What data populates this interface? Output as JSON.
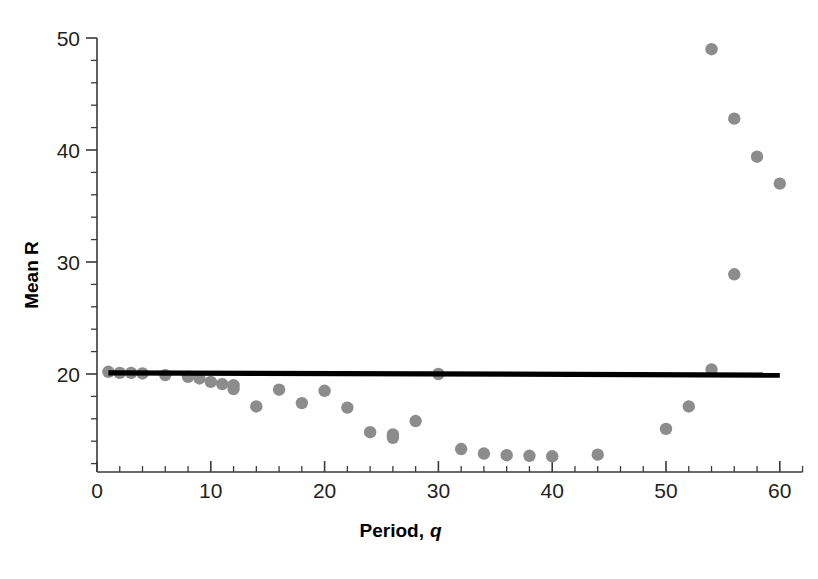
{
  "chart_data": {
    "type": "scatter",
    "title": "",
    "xlabel": "Period, q",
    "xlabel_parts": {
      "main": "Period,",
      "italic": "q"
    },
    "ylabel": "Mean R",
    "xlim": [
      0,
      62
    ],
    "ylim": [
      11,
      50
    ],
    "grid": false,
    "legend": null,
    "x_ticks_major": [
      0,
      10,
      20,
      30,
      40,
      50,
      60
    ],
    "x_tick_labels": [
      "0",
      "10",
      "20",
      "30",
      "40",
      "50",
      "60"
    ],
    "x_tick_minor_step": 2,
    "y_ticks_major": [
      20,
      30,
      40,
      50
    ],
    "y_tick_labels": [
      "20",
      "30",
      "40",
      "50"
    ],
    "y_tick_minor_step": 2,
    "series": [
      {
        "name": "Mean R",
        "type": "scatter",
        "marker": "circle",
        "color": "#8c8c8c",
        "x": [
          1,
          2,
          3,
          4,
          6,
          8,
          9,
          10,
          11,
          12,
          12,
          14,
          16,
          18,
          20,
          22,
          24,
          26,
          26,
          28,
          30,
          32,
          34,
          36,
          38,
          40,
          44,
          50,
          52,
          54,
          54,
          56,
          56,
          58,
          60
        ],
        "y": [
          20.2,
          20.1,
          20.1,
          20.05,
          19.9,
          19.75,
          19.6,
          19.3,
          19.1,
          19.0,
          18.65,
          17.1,
          18.6,
          17.4,
          18.5,
          17.0,
          14.8,
          14.6,
          14.3,
          15.8,
          20.0,
          13.3,
          12.9,
          12.75,
          12.7,
          12.65,
          12.8,
          15.1,
          17.1,
          49.0,
          20.4,
          42.8,
          28.9,
          39.4,
          37.0
        ]
      },
      {
        "name": "fit line",
        "type": "line",
        "color": "#000000",
        "x": [
          1,
          60
        ],
        "y": [
          20.1,
          19.9
        ]
      }
    ]
  }
}
